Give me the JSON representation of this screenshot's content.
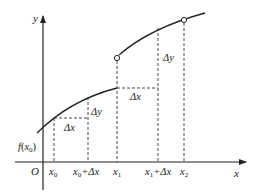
{
  "diagram": {
    "axes": {
      "x_label": "x",
      "y_label": "y",
      "origin_label": "O"
    },
    "x_ticks": [
      {
        "id": "x0",
        "label_main": "x",
        "label_sub": "0",
        "label_suffix": ""
      },
      {
        "id": "x0_dx",
        "label_main": "x",
        "label_sub": "0",
        "label_suffix": "+Δx"
      },
      {
        "id": "x1",
        "label_main": "x",
        "label_sub": "1",
        "label_suffix": ""
      },
      {
        "id": "x1_dx",
        "label_main": "x",
        "label_sub": "1",
        "label_suffix": "+Δx"
      },
      {
        "id": "x2",
        "label_main": "x",
        "label_sub": "2",
        "label_suffix": ""
      }
    ],
    "y_tick": {
      "label_f": "f",
      "label_open": "(",
      "label_main": "x",
      "label_sub": "0",
      "label_close": ")"
    },
    "annotations": {
      "dx_left": "Δx",
      "dy_left": "Δy",
      "dx_right": "Δx",
      "dy_right": "Δy"
    },
    "colors": {
      "line": "#222222",
      "dashed": "#333333",
      "background": "#ffffff"
    }
  }
}
